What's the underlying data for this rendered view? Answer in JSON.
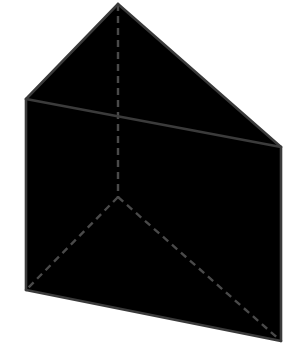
{
  "figure": {
    "canvas": {
      "width": 299,
      "height": 359,
      "background_color": "#ffffff"
    },
    "style": {
      "solid_stroke_color": "#3b3b3b",
      "solid_stroke_width": 2.6,
      "hidden_stroke_color": "#4a4a4a",
      "hidden_stroke_width": 2.4,
      "hidden_dash_pattern": "7 5",
      "face_fill": "#ffffff"
    },
    "vertices": {
      "apex_back_top": {
        "label": "apex-back-top",
        "x": 118,
        "y": 4,
        "visible": true
      },
      "front_top_left": {
        "label": "front-top-left",
        "x": 26,
        "y": 99,
        "visible": true
      },
      "front_top_right": {
        "label": "front-top-right",
        "x": 281,
        "y": 147,
        "visible": true
      },
      "front_bottom_left": {
        "label": "front-bottom-left",
        "x": 26,
        "y": 290,
        "visible": true
      },
      "front_bottom_right": {
        "label": "front-bottom-right",
        "x": 281,
        "y": 341,
        "visible": true
      },
      "back_bottom_hidden": {
        "label": "back-bottom-hidden",
        "x": 118,
        "y": 197,
        "visible": false
      }
    },
    "faces": [
      {
        "name": "top-left-face",
        "points": "118,4 26,99 281,147",
        "fill": "#ffffff"
      },
      {
        "name": "front-rectangular-face",
        "points": "26,99 281,147 281,341 26,290",
        "fill": "#ffffff"
      }
    ],
    "edges_solid": [
      {
        "name": "edge-apex-to-front-top-left",
        "points": "118,4 26,99"
      },
      {
        "name": "edge-apex-to-front-top-right",
        "points": "118,4 281,147"
      },
      {
        "name": "edge-front-top-left-to-front-top-right",
        "points": "26,99 281,147"
      },
      {
        "name": "edge-front-top-left-to-front-bottom-left",
        "points": "26,99 26,290"
      },
      {
        "name": "edge-front-top-right-to-front-bottom-right",
        "points": "281,147 281,341"
      },
      {
        "name": "edge-front-bottom-left-to-front-bottom-right",
        "points": "26,290 281,341"
      }
    ],
    "edges_hidden": [
      {
        "name": "edge-apex-to-back-bottom-vertical",
        "points": "118,4 118,197"
      },
      {
        "name": "edge-back-bottom-to-front-bottom-left",
        "points": "118,197 26,290"
      },
      {
        "name": "edge-back-bottom-to-front-bottom-right",
        "points": "118,197 281,341"
      }
    ]
  }
}
